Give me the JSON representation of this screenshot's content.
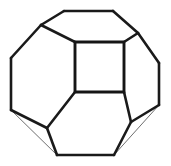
{
  "figure": {
    "background_color": "#ffffff",
    "stroke_color": "#1a1a1a",
    "faint_stroke_color": "#6f6f6f",
    "canvas": {
      "width": 171,
      "height": 166
    },
    "vertices": {
      "top_left": [
        64,
        11
      ],
      "top_right": [
        113,
        11
      ],
      "upper_left_shoulder": [
        41,
        25
      ],
      "upper_right_shoulder": [
        138,
        33
      ],
      "left_upper": [
        11,
        58
      ],
      "right_upper": [
        159,
        63
      ],
      "left_lower": [
        11,
        110
      ],
      "right_lower": [
        159,
        105
      ],
      "lower_left_knee": [
        47,
        128
      ],
      "lower_right_knee": [
        131,
        122
      ],
      "bottom_left": [
        57,
        155
      ],
      "bottom_right": [
        114,
        155
      ],
      "square_tl": [
        75,
        42
      ],
      "square_tr": [
        124,
        42
      ],
      "square_bl": [
        75,
        92
      ],
      "square_br": [
        124,
        92
      ]
    },
    "edges": [
      {
        "name": "top-edge",
        "from": "top_left",
        "to": "top_right"
      },
      {
        "name": "upper-left-bevel",
        "from": "upper_left_shoulder",
        "to": "top_left"
      },
      {
        "name": "upper-right-bevel",
        "from": "top_right",
        "to": "upper_right_shoulder"
      },
      {
        "name": "left-upper-bevel",
        "from": "left_upper",
        "to": "upper_left_shoulder"
      },
      {
        "name": "right-upper-bevel",
        "from": "upper_right_shoulder",
        "to": "right_upper"
      },
      {
        "name": "left-side-edge",
        "from": "left_upper",
        "to": "left_lower"
      },
      {
        "name": "right-side-edge",
        "from": "right_upper",
        "to": "right_lower"
      },
      {
        "name": "lower-left-bevel",
        "from": "left_lower",
        "to": "lower_left_knee"
      },
      {
        "name": "lower-right-bevel",
        "from": "right_lower",
        "to": "lower_right_knee"
      },
      {
        "name": "bottom-left-bevel",
        "from": "lower_left_knee",
        "to": "bottom_left"
      },
      {
        "name": "bottom-right-bevel",
        "from": "lower_right_knee",
        "to": "bottom_right"
      },
      {
        "name": "bottom-edge",
        "from": "bottom_left",
        "to": "bottom_right"
      },
      {
        "name": "spoke-upper-left",
        "from": "upper_left_shoulder",
        "to": "square_tl"
      },
      {
        "name": "spoke-upper-right",
        "from": "upper_right_shoulder",
        "to": "square_tr"
      },
      {
        "name": "spoke-lower-left",
        "from": "square_bl",
        "to": "lower_left_knee"
      },
      {
        "name": "spoke-lower-right",
        "from": "square_br",
        "to": "lower_right_knee"
      }
    ],
    "faint_edges": [
      {
        "name": "hidden-left-chord",
        "from": "left_lower",
        "to": "bottom_left"
      },
      {
        "name": "hidden-right-chord",
        "from": "right_lower",
        "to": "bottom_right"
      }
    ],
    "square_face": {
      "name": "front-square-face",
      "points": "75,42 124,42 124,92 75,92"
    },
    "outline_polygon": {
      "name": "silhouette",
      "points": "64,11 113,11 138,33 159,63 159,105 114,155 57,155 11,110 11,58 41,25"
    }
  }
}
